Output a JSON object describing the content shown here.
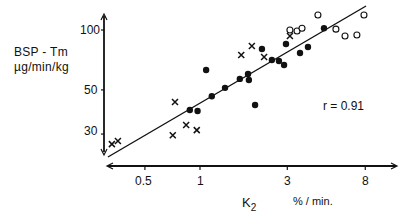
{
  "chart_data": {
    "type": "scatter",
    "title": "",
    "xlabel": "K2",
    "xlabel_unit": "% / min.",
    "ylabel": "BSP - Tm",
    "ylabel_unit": "µg/min/kg",
    "x_scale": "log",
    "y_scale": "log",
    "xticks": [
      0.5,
      1,
      3,
      8
    ],
    "xtick_labels": [
      "0.5",
      "1",
      "3",
      "8"
    ],
    "yticks": [
      30,
      50,
      100
    ],
    "ytick_labels": [
      "30",
      "50",
      "100"
    ],
    "xlim": [
      0.3,
      11
    ],
    "ylim": [
      22,
      125
    ],
    "grid": false,
    "legend": null,
    "annotations": [
      "r = 0.91"
    ],
    "series": [
      {
        "name": "filled circles",
        "marker": "filled-circle",
        "points": [
          [
            0.88,
            39.6
          ],
          [
            0.97,
            39.2
          ],
          [
            1.08,
            63.0
          ],
          [
            1.16,
            46.5
          ],
          [
            1.37,
            51.2
          ],
          [
            1.65,
            56.8
          ],
          [
            1.83,
            60.1
          ],
          [
            1.85,
            56.1
          ],
          [
            2.0,
            42.0
          ],
          [
            2.18,
            80.3
          ],
          [
            2.47,
            70.7
          ],
          [
            2.7,
            69.9
          ],
          [
            2.88,
            66.7
          ],
          [
            2.95,
            85.0
          ],
          [
            3.52,
            76.6
          ],
          [
            3.89,
            82.2
          ],
          [
            4.76,
            102.0
          ]
        ]
      },
      {
        "name": "crosses",
        "marker": "x",
        "points": [
          [
            0.33,
            26.7
          ],
          [
            0.356,
            27.7
          ],
          [
            0.71,
            29.6
          ],
          [
            0.73,
            43.5
          ],
          [
            0.84,
            33.3
          ],
          [
            0.96,
            31.4
          ],
          [
            1.68,
            74.8
          ],
          [
            1.92,
            83.1
          ],
          [
            2.24,
            73.1
          ],
          [
            3.1,
            93.3
          ]
        ]
      },
      {
        "name": "open circles",
        "marker": "open-circle",
        "points": [
          [
            3.1,
            100.0
          ],
          [
            3.39,
            98.8
          ],
          [
            3.61,
            102.0
          ],
          [
            4.41,
            119.0
          ],
          [
            5.53,
            101.0
          ],
          [
            6.2,
            93.3
          ],
          [
            7.2,
            94.4
          ],
          [
            7.87,
            119.0
          ]
        ]
      }
    ],
    "regression_line": {
      "from": [
        0.314,
        23.0
      ],
      "to": [
        8.08,
        132.0
      ],
      "r": 0.91
    }
  },
  "labels": {
    "ylabel_line1": "BSP - Tm",
    "ylabel_line2": "µg/min/kg",
    "xlabel_main": "K",
    "xlabel_sub": "2",
    "xlabel_unit": "% / min.",
    "r_annotation": "r = 0.91",
    "yticks": [
      "100",
      "50",
      "30"
    ],
    "xticks": [
      "0.5",
      "1",
      "3",
      "8"
    ]
  }
}
